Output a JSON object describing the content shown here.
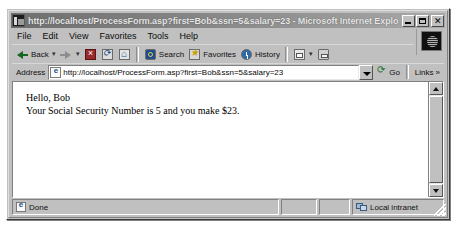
{
  "window": {
    "title": "http://localhost/ProcessForm.asp?first=Bob&ssn=5&salary=23 - Microsoft Internet Explorer",
    "title_icon": "ie-document-icon",
    "controls": {
      "minimize": "minimize-button",
      "maximize": "maximize-button",
      "close_glyph": "✕"
    }
  },
  "menubar": {
    "items": [
      {
        "label": "File"
      },
      {
        "label": "Edit"
      },
      {
        "label": "View"
      },
      {
        "label": "Favorites"
      },
      {
        "label": "Tools"
      },
      {
        "label": "Help"
      }
    ]
  },
  "toolbar": {
    "back_label": "Back",
    "forward_label": "",
    "stop_label": "",
    "refresh_label": "",
    "home_label": "",
    "search_label": "Search",
    "favorites_label": "Favorites",
    "history_label": "History",
    "mail_label": "",
    "print_label": "",
    "dropdown_caret": "▾"
  },
  "address_bar": {
    "label": "Address",
    "url": "http://localhost/ProcessForm.asp?first=Bob&ssn=5&salary=23",
    "placeholder": "",
    "go_label": "Go",
    "links_label": "Links",
    "links_chevron": "»"
  },
  "page": {
    "lines": [
      "Hello, Bob",
      "Your Social Security Number is 5 and you make $23."
    ]
  },
  "statusbar": {
    "status_text": "Done",
    "zone_text": "Local intranet"
  },
  "colors": {
    "window_face": "#c0c0c0",
    "titlebar_start": "#6e6e6e",
    "titlebar_end": "#a9a9a9",
    "titlebar_text": "#e8e8e8",
    "page_background": "#ffffff",
    "page_text": "#000000"
  }
}
